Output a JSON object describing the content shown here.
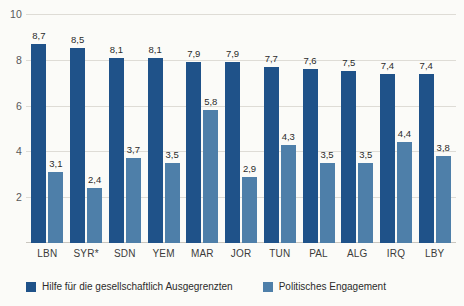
{
  "chart_data": {
    "type": "bar",
    "title": "",
    "subtitle": "",
    "xlabel": "",
    "ylabel": "",
    "ylim": [
      0,
      10
    ],
    "yticks": [
      2,
      4,
      6,
      8,
      10
    ],
    "ytick_labels": [
      "2",
      "4",
      "6",
      "8",
      "10"
    ],
    "grid": true,
    "legend_position": "bottom-left",
    "categories": [
      "LBN",
      "SYR*",
      "SDN",
      "YEM",
      "MAR",
      "JOR",
      "TUN",
      "PAL",
      "ALG",
      "IRQ",
      "LBY"
    ],
    "series": [
      {
        "name": "Hilfe für die gesellschaftlich Ausgegrenzten",
        "color": "#1f5289",
        "values": [
          8.7,
          8.5,
          8.1,
          8.1,
          7.9,
          7.9,
          7.7,
          7.6,
          7.5,
          7.4,
          7.4
        ],
        "labels": [
          "8,7",
          "8,5",
          "8,1",
          "8,1",
          "7,9",
          "7,9",
          "7,7",
          "7,6",
          "7,5",
          "7,4",
          "7,4"
        ]
      },
      {
        "name": "Politisches Engagement",
        "color": "#4e7fa9",
        "values": [
          3.1,
          2.4,
          3.7,
          3.5,
          5.8,
          2.9,
          4.3,
          3.5,
          3.5,
          4.4,
          3.8
        ],
        "labels": [
          "3,1",
          "2,4",
          "3,7",
          "3,5",
          "5,8",
          "2,9",
          "4,3",
          "3,5",
          "3,5",
          "4,4",
          "3,8"
        ]
      }
    ],
    "colors": {
      "series_dark": "#1f5289",
      "series_light": "#4e7fa9",
      "background": "#fbfbf8",
      "gridline": "#dedcd6",
      "tick_text": "#58585a"
    }
  }
}
